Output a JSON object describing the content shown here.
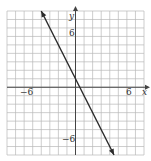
{
  "chart_data": {
    "type": "line",
    "title": "",
    "xlabel": "x",
    "ylabel": "y",
    "xlim": [
      -8,
      8
    ],
    "ylim": [
      -8,
      9
    ],
    "grid": true,
    "x_tick_labels": [
      "-6",
      "6"
    ],
    "y_tick_labels": [
      "6",
      "-6"
    ],
    "series": [
      {
        "name": "line",
        "equation": "y = -2x + 1",
        "slope": -2,
        "intercept": 1,
        "x": [
          -4,
          4.5
        ],
        "y": [
          9,
          -8
        ],
        "arrows": "both"
      }
    ]
  },
  "labels": {
    "x_axis": "x",
    "y_axis": "y",
    "x_neg": "−6",
    "x_pos": "6",
    "y_pos": "6",
    "y_neg": "−6"
  },
  "colors": {
    "grid": "#b8b8b8",
    "axis": "#444444",
    "line": "#2a2a2a"
  }
}
